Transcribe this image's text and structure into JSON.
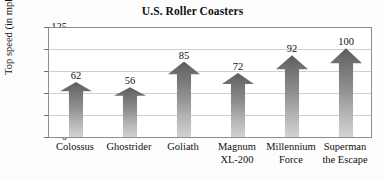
{
  "chart_data": {
    "type": "bar",
    "title": "U.S. Roller Coasters",
    "xlabel": "",
    "ylabel": "Top speed (in mph)",
    "ylim": [
      0,
      125
    ],
    "yticks": [
      0,
      25,
      50,
      75,
      100,
      125
    ],
    "grid": true,
    "legend": null,
    "categories": [
      "Colossus",
      "Ghostrider",
      "Goliath",
      "Magnum XL-200",
      "Millennium Force",
      "Superman the Escape"
    ],
    "category_lines": [
      [
        "Colossus",
        ""
      ],
      [
        "Ghostrider",
        ""
      ],
      [
        "Goliath",
        ""
      ],
      [
        "Magnum",
        "XL-200"
      ],
      [
        "Millennium",
        "Force"
      ],
      [
        "Superman",
        "the Escape"
      ]
    ],
    "values": [
      62,
      56,
      85,
      72,
      92,
      100
    ],
    "value_labels": [
      "62",
      "56",
      "85",
      "72",
      "92",
      "100"
    ],
    "bar_style": "arrow",
    "bar_fill_top": "#5b5b5b",
    "bar_fill_bottom": "#d2d2d2",
    "frame_color": "#8d8d8d",
    "grid_color": "#cfcfcf",
    "background": "#fdfdfd"
  },
  "yticks_text": {
    "t0": "0",
    "t1": "25",
    "t2": "50",
    "t3": "75",
    "t4": "100",
    "t5": "125"
  }
}
